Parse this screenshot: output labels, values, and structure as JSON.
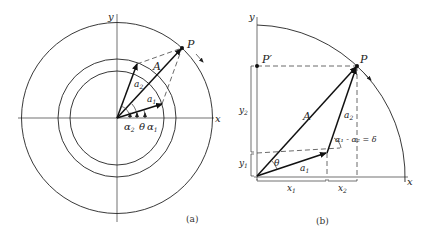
{
  "figure": {
    "panel_a": {
      "caption": "(a)",
      "axis_x_label": "x",
      "axis_y_label": "y",
      "point_label": "P",
      "resultant_label": "A",
      "vector1_label": "a",
      "vector1_sub": "1",
      "vector2_label": "a",
      "vector2_sub": "2",
      "angle_labels": {
        "alpha2": "α",
        "alpha2_sub": "2",
        "theta": "θ",
        "alpha1": "α",
        "alpha1_sub": "1"
      }
    },
    "panel_b": {
      "caption": "(b)",
      "axis_x_label": "x",
      "axis_y_label": "y",
      "point_label": "P",
      "projection_label": "P′",
      "resultant_label": "A",
      "vector1_label": "a",
      "vector1_sub": "1",
      "vector2_label": "a",
      "vector2_sub": "2",
      "theta_label": "θ",
      "phase_diff_label": "α₁ - α₂ = δ",
      "x1_label": "x",
      "x1_sub": "1",
      "x2_label": "x",
      "x2_sub": "2",
      "y1_label": "y",
      "y1_sub": "1",
      "y2_label": "y",
      "y2_sub": "2"
    },
    "colors": {
      "ink": "#222222",
      "background": "#ffffff"
    }
  }
}
